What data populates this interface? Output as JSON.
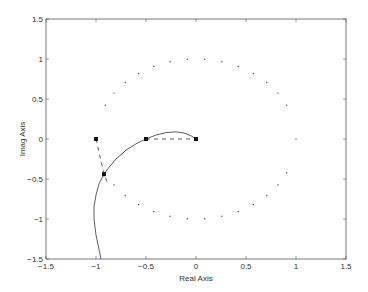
{
  "chart_data": {
    "type": "line",
    "title": "",
    "xlabel": "Real Axis",
    "ylabel": "Imag Axis",
    "xlim": [
      -1.5,
      1.5
    ],
    "ylim": [
      -1.5,
      1.5
    ],
    "grid": false,
    "legend": null,
    "xticks": [
      -1.5,
      -1,
      -0.5,
      0,
      0.5,
      1,
      1.5
    ],
    "xtick_labels": [
      "-1.5",
      "-1",
      "-0.5",
      "0",
      "0.5",
      "1",
      "1.5"
    ],
    "yticks": [
      -1.5,
      -1,
      -0.5,
      0,
      0.5,
      1,
      1.5
    ],
    "ytick_labels": [
      "-1.5",
      "-1",
      "-0.5",
      "0",
      "0.5",
      "1",
      "1.5"
    ],
    "series": [
      {
        "name": "unit-circle",
        "style": "dotted",
        "description": "Stability boundary (unit circle), dotted, gaps near the real axis on the left",
        "radius": 1.0,
        "dot_angles_deg": [
          0,
          25,
          35,
          45,
          55,
          65,
          75,
          85,
          95,
          105,
          115,
          125,
          135,
          145,
          155,
          -25,
          -35,
          -45,
          -55,
          -65,
          -75,
          -85,
          -95,
          -105,
          -115,
          -125,
          -135,
          -145,
          -155
        ]
      },
      {
        "name": "root-locus-branch",
        "style": "solid",
        "points": [
          [
            0,
            0
          ],
          [
            -0.05,
            0.04
          ],
          [
            -0.12,
            0.075
          ],
          [
            -0.2,
            0.09
          ],
          [
            -0.3,
            0.08
          ],
          [
            -0.4,
            0.05
          ],
          [
            -0.5,
            0.0
          ],
          [
            -0.6,
            -0.06
          ],
          [
            -0.7,
            -0.14
          ],
          [
            -0.8,
            -0.25
          ],
          [
            -0.88,
            -0.37
          ],
          [
            -0.92,
            -0.44
          ],
          [
            -0.97,
            -0.56
          ],
          [
            -1.0,
            -0.7
          ],
          [
            -1.02,
            -0.85
          ],
          [
            -1.02,
            -1.0
          ],
          [
            -1.0,
            -1.2
          ],
          [
            -0.95,
            -1.5
          ]
        ]
      },
      {
        "name": "dashed-real-segment",
        "style": "dashed",
        "points": [
          [
            -0.5,
            0.0
          ],
          [
            0.0,
            0.0
          ]
        ]
      },
      {
        "name": "dashed-left-segment",
        "style": "dashed",
        "points": [
          [
            -1.0,
            0.0
          ],
          [
            -0.92,
            -0.44
          ],
          [
            -0.88,
            -0.56
          ]
        ]
      }
    ],
    "markers": [
      {
        "x": -1.0,
        "y": 0.0,
        "symbol": "square"
      },
      {
        "x": -0.5,
        "y": 0.0,
        "symbol": "square"
      },
      {
        "x": 0.0,
        "y": 0.0,
        "symbol": "square"
      },
      {
        "x": -0.92,
        "y": -0.44,
        "symbol": "square"
      }
    ]
  },
  "colors": {
    "frame": "#555555",
    "curve": "#333333",
    "dots": "#444444",
    "marker": "#111111"
  }
}
